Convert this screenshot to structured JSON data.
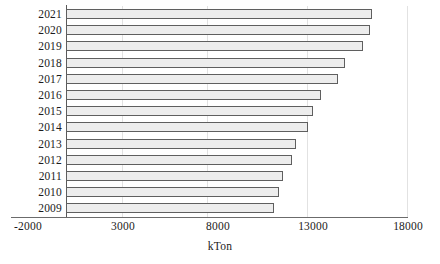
{
  "chart_data": {
    "type": "bar",
    "orientation": "horizontal",
    "title": "",
    "subtitle": "",
    "xlabel": "kTon",
    "ylabel": "",
    "categories": [
      "2021",
      "2020",
      "2019",
      "2018",
      "2017",
      "2016",
      "2015",
      "2014",
      "2013",
      "2012",
      "2011",
      "2010",
      "2009"
    ],
    "values": [
      16100,
      15990,
      15650,
      14700,
      14300,
      13400,
      13000,
      12750,
      12100,
      11900,
      11400,
      11200,
      10950
    ],
    "series": [
      {
        "name": "kTon",
        "values": [
          16100,
          15990,
          15650,
          14700,
          14300,
          13400,
          13000,
          12750,
          12100,
          11900,
          11400,
          11200,
          10950
        ]
      }
    ],
    "xlim": [
      -2000,
      18000
    ],
    "xticks": [
      -2000,
      3000,
      8000,
      13000,
      18000
    ],
    "xtick_labels": [
      "-2000",
      "3000",
      "8000",
      "13000",
      "18000"
    ],
    "grid": true,
    "grid_axis": "x",
    "legend": false,
    "legend_position": "none",
    "bar_fill_color": "#ededed",
    "bar_border_color": "#5f5f5f",
    "gridline_color": "#e2e2e2",
    "axis_color": "#5a5a5a",
    "text_color": "#1b1b1b",
    "background_color": "#ffffff"
  }
}
